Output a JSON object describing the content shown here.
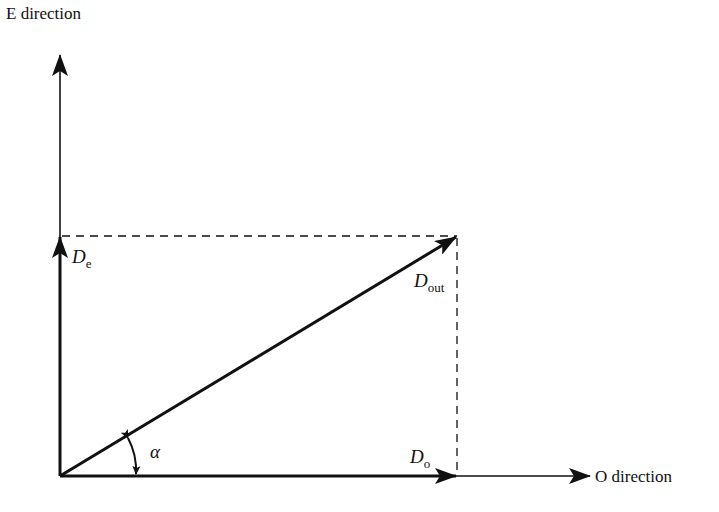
{
  "diagram": {
    "axes": {
      "vertical_label": "E direction",
      "horizontal_label": "O direction"
    },
    "vectors": {
      "e_component": {
        "symbol": "D",
        "subscript": "e"
      },
      "o_component": {
        "symbol": "D",
        "subscript": "o"
      },
      "output": {
        "symbol": "D",
        "subscript": "out"
      }
    },
    "angle": {
      "symbol": "α"
    },
    "colors": {
      "stroke": "#111111",
      "background": "#ffffff"
    }
  }
}
